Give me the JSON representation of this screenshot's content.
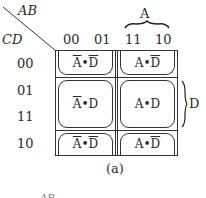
{
  "kmap": {
    "row_var": "CD",
    "col_var": "AB",
    "col_headers": [
      "00",
      "01",
      "11",
      "10"
    ],
    "row_headers": [
      "00",
      "01",
      "11",
      "10"
    ],
    "col_group_label": "A",
    "row_group_label": "D",
    "caption": "(a)",
    "loops": [
      {
        "terms": [
          {
            "text": "A",
            "bar": true
          },
          {
            "text": "•",
            "bar": false
          },
          {
            "text": "D",
            "bar": true
          }
        ]
      },
      {
        "terms": [
          {
            "text": "A",
            "bar": false
          },
          {
            "text": "•",
            "bar": false
          },
          {
            "text": "D",
            "bar": true
          }
        ]
      },
      {
        "terms": [
          {
            "text": "A",
            "bar": true
          },
          {
            "text": "•",
            "bar": false
          },
          {
            "text": "D",
            "bar": false
          }
        ]
      },
      {
        "terms": [
          {
            "text": "A",
            "bar": false
          },
          {
            "text": "•",
            "bar": false
          },
          {
            "text": "D",
            "bar": false
          }
        ]
      },
      {
        "terms": [
          {
            "text": "A",
            "bar": true
          },
          {
            "text": "•",
            "bar": false
          },
          {
            "text": "D",
            "bar": true
          }
        ]
      },
      {
        "terms": [
          {
            "text": "A",
            "bar": false
          },
          {
            "text": "•",
            "bar": false
          },
          {
            "text": "D",
            "bar": true
          }
        ]
      }
    ]
  },
  "next_figure_fragment": "AB"
}
